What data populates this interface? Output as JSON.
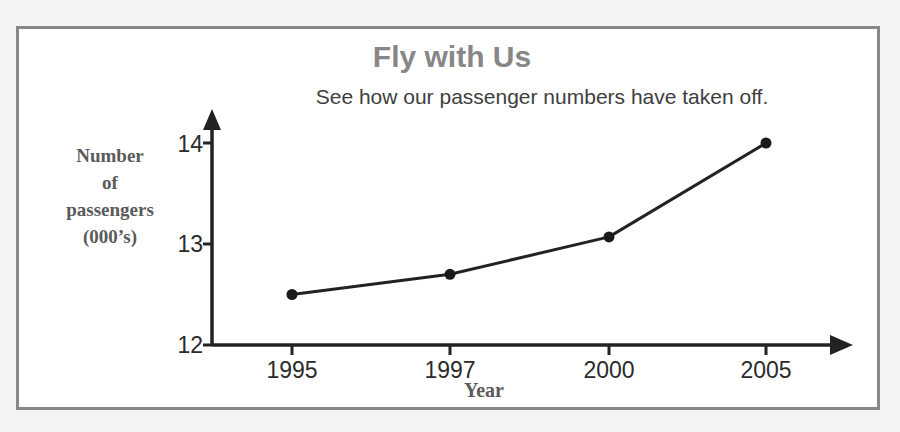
{
  "poster": {
    "frame_color": "#888888",
    "background": "#ffffff",
    "page_background": "#f4f4f4"
  },
  "chart_data": {
    "type": "line",
    "title": "Fly with Us",
    "subtitle": "See how our passenger numbers have taken off.",
    "xlabel": "Year",
    "ylabel": "Number of passengers (000's)",
    "ylabel_lines": [
      "Number",
      "of",
      "passengers",
      "(000’s)"
    ],
    "categories": [
      "1995",
      "1997",
      "2000",
      "2005"
    ],
    "values": [
      12.5,
      12.7,
      13.07,
      14.0
    ],
    "series": [
      {
        "name": "Passengers",
        "values": [
          12.5,
          12.7,
          13.07,
          14.0
        ]
      }
    ],
    "yticks": [
      "12",
      "13",
      "14"
    ],
    "ytick_values": [
      12,
      13,
      14
    ],
    "ylim": [
      12,
      14.35
    ],
    "grid": false,
    "legend": false,
    "marker": "filled-circle",
    "line_color": "#222222",
    "marker_color": "#1a1a1a",
    "axis_color": "#222222",
    "axis_arrows": true,
    "title_color": "#878787",
    "subtitle_color": "#3e3e3e",
    "axis_label_color": "#5a5a5a",
    "tick_label_color": "#2b2b2b"
  }
}
